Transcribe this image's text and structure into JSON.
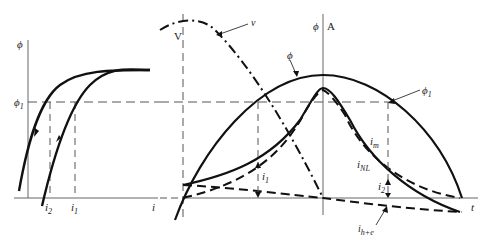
{
  "figure": {
    "left_graph": {
      "y_axis_label": "ϕ",
      "x_axis_label": "i",
      "level_label": "ϕ",
      "level_label_sub": "1",
      "i2_label": "i",
      "i2_sub": "2",
      "i1_label": "i",
      "i1_sub": "1",
      "description": "Hysteresis loop of flux vs current"
    },
    "right_graph": {
      "voltage_axis_label": "V",
      "flux_axis_label": "ϕ",
      "current_axis_label": "A",
      "time_axis_label": "t",
      "curves": {
        "voltage": "v",
        "flux": "ϕ",
        "flux_level": "ϕ",
        "flux_level_sub": "1",
        "magnetizing_current": "i",
        "magnetizing_sub": "m",
        "no_load_current": "i",
        "no_load_sub": "NL",
        "i1": "i",
        "i1_sub": "1",
        "i2": "i",
        "i2_sub": "2",
        "core_loss_current": "i",
        "core_loss_sub": "h+e"
      }
    },
    "colors": {
      "stroke": "#111111",
      "axis": "#555555",
      "background": "#ffffff"
    }
  }
}
